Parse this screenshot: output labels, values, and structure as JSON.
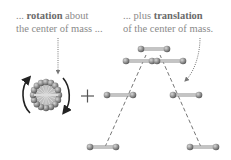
{
  "captions": {
    "left": {
      "line1_prefix": "... ",
      "line1_bold": "rotation",
      "line1_suffix": " about",
      "line2": "the center of mass ..."
    },
    "right": {
      "line1_prefix": "... ",
      "line1_bold": "translation",
      "line1_prefix_word": "plus ",
      "line2": "of the center of mass."
    }
  },
  "operator": "+",
  "colors": {
    "text": "#8a8a8a",
    "text_bold": "#6a6a6a",
    "atom": "#8c8c8c",
    "bond": "#b5b5b5",
    "arrow": "#222222",
    "dash": "#666666"
  },
  "icons": {
    "rotation": "rotating-molecule-icon",
    "rotation_arrows": "curved-arrow-icon",
    "plus": "plus-icon",
    "translation_molecules": "diatomic-molecule-icon"
  }
}
